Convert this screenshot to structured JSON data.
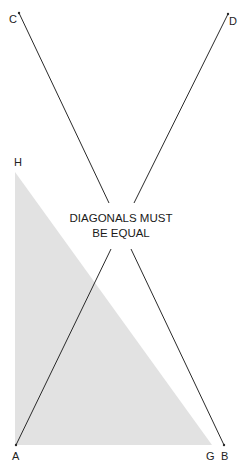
{
  "diagram": {
    "caption_line1": "DIAGONALS MUST",
    "caption_line2": "BE EQUAL",
    "points": {
      "A": {
        "label": "A"
      },
      "B": {
        "label": "B"
      },
      "C": {
        "label": "C"
      },
      "D": {
        "label": "D"
      },
      "G": {
        "label": "G"
      },
      "H": {
        "label": "H"
      }
    },
    "colors": {
      "line": "#2a2a2a",
      "triangle_fill": "#e2e2e2",
      "background": "#ffffff"
    }
  }
}
